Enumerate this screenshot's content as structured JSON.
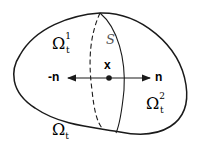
{
  "diagram": {
    "region_label": "Ω",
    "region_sub": "t",
    "left_label": "Ω",
    "left_sup": "1",
    "left_sub": "t",
    "right_label": "Ω",
    "right_sup": "2",
    "right_sub": "t",
    "surface_label": "S",
    "point_label": "x",
    "normal_pos": "n",
    "normal_neg": "-n",
    "colors": {
      "stroke": "#1a1a1a",
      "background": "#ffffff"
    }
  }
}
